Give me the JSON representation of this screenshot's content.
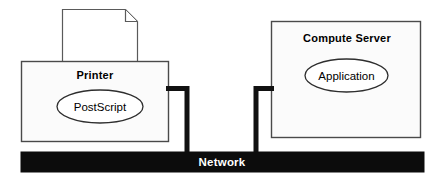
{
  "diagram": {
    "colors": {
      "stroke": "#4a4a4a",
      "box_fill": "#fbfbfb",
      "bus_fill": "#0c0c0c",
      "bus_text": "#ffffff",
      "connector": "#111111",
      "text": "#000000"
    },
    "nodes": [
      {
        "id": "printer",
        "label": "Printer",
        "component_label": "PostScript"
      },
      {
        "id": "compute-server",
        "label": "Compute  Server",
        "component_label": "Application"
      }
    ],
    "paper": {
      "label": "paper-sheet"
    },
    "bus": {
      "label": "Network"
    },
    "connectors": [
      {
        "id": "printer-to-network",
        "from": "printer",
        "to": "bus"
      },
      {
        "id": "compute-server-to-network",
        "from": "compute-server",
        "to": "bus"
      }
    ]
  }
}
